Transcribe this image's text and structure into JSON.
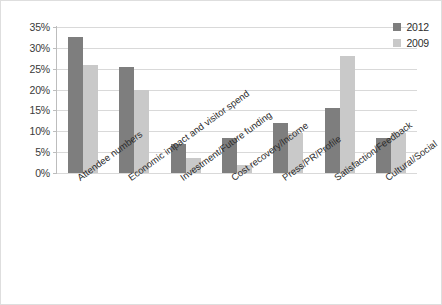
{
  "chart_data": {
    "type": "bar",
    "title": "",
    "xlabel": "",
    "ylabel": "",
    "ylim": [
      0,
      35
    ],
    "ytick_labels": [
      "35%",
      "30%",
      "25%",
      "20%",
      "15%",
      "10%",
      "5%",
      "0%"
    ],
    "ytick_values": [
      35,
      30,
      25,
      20,
      15,
      10,
      5,
      0
    ],
    "grid": true,
    "legend_position": "top-right",
    "categories": [
      "Attendee numbers",
      "Economic impact and visitor spend",
      "Investment/Future funding",
      "Cost recovery/Income",
      "Press/PR/Profile",
      "Satisfaction/Feedback",
      "Cultural/Social"
    ],
    "series": [
      {
        "name": "2012",
        "color": "#7e7e7e",
        "values": [
          32.5,
          25.5,
          7,
          8.5,
          12,
          15.5,
          8.5
        ]
      },
      {
        "name": "2009",
        "color": "#c9c9c9",
        "values": [
          26,
          20,
          3.5,
          2,
          9.5,
          28,
          9.5
        ]
      }
    ]
  },
  "legend": {
    "items": [
      {
        "label": "2012",
        "color": "#7e7e7e"
      },
      {
        "label": "2009",
        "color": "#c9c9c9"
      }
    ]
  }
}
